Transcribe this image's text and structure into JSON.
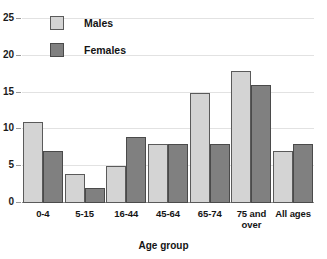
{
  "chart_data": {
    "type": "bar",
    "title": "",
    "xlabel": "Age group",
    "ylabel": "",
    "categories": [
      "0-4",
      "5-15",
      "16-44",
      "45-64",
      "65-74",
      "75 and over",
      "All ages"
    ],
    "series": [
      {
        "name": "Males",
        "values": [
          11,
          4,
          5,
          8,
          15,
          18,
          7
        ],
        "color": "#d4d4d4"
      },
      {
        "name": "Females",
        "values": [
          7,
          2,
          9,
          8,
          8,
          16,
          8
        ],
        "color": "#808080"
      }
    ],
    "ylim": [
      0,
      25
    ],
    "ytick_labels": [
      "0",
      "5",
      "10",
      "15",
      "20",
      "25"
    ],
    "ytick_values": [
      0,
      5,
      10,
      15,
      20,
      25
    ],
    "grid": true,
    "legend_position": "top-left"
  },
  "legend": {
    "entries": [
      {
        "label": "Males"
      },
      {
        "label": "Females"
      }
    ]
  },
  "axis": {
    "x_title": "Age group",
    "category_labels": [
      {
        "line1": "0-4",
        "line2": ""
      },
      {
        "line1": "5-15",
        "line2": ""
      },
      {
        "line1": "16-44",
        "line2": ""
      },
      {
        "line1": "45-64",
        "line2": ""
      },
      {
        "line1": "65-74",
        "line2": ""
      },
      {
        "line1": "75 and",
        "line2": "over"
      },
      {
        "line1": "All ages",
        "line2": ""
      }
    ]
  },
  "colors": {
    "males_fill": "#d4d4d4",
    "females_fill": "#808080",
    "bar_border": "#5a5a5a",
    "gridline": "#e2e2e2",
    "axis_line": "#8c8c8c",
    "text": "#141414",
    "background": "#ffffff"
  }
}
